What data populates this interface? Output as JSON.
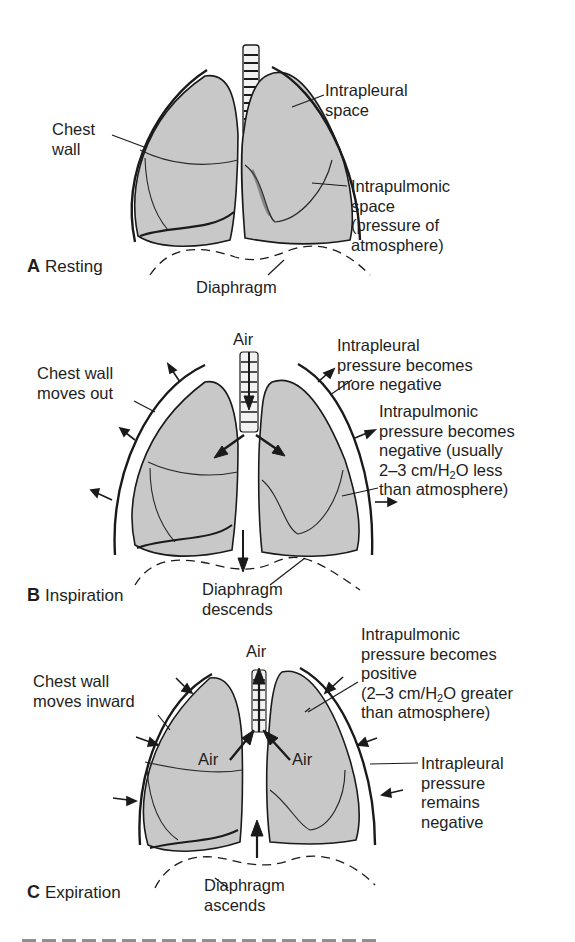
{
  "figure": {
    "panels": [
      {
        "id": "A",
        "letter": "A",
        "title": "Resting",
        "labels": {
          "chest_wall": [
            "Chest",
            "wall"
          ],
          "intrapleural": [
            "Intrapleural",
            "space"
          ],
          "intrapulmonic": [
            "Intrapulmonic",
            "space",
            "(pressure of",
            "atmosphere)"
          ],
          "diaphragm": [
            "Diaphragm"
          ]
        }
      },
      {
        "id": "B",
        "letter": "B",
        "title": "Inspiration",
        "labels": {
          "air": "Air",
          "chest_wall": [
            "Chest wall",
            "moves out"
          ],
          "intrapleural": [
            "Intrapleural",
            "pressure becomes",
            "more negative"
          ],
          "intrapulmonic": [
            "Intrapulmonic",
            "pressure becomes",
            "negative (usually",
            "2–3 cm/H",
            "2",
            "O less",
            "than atmosphere)"
          ],
          "diaphragm": [
            "Diaphragm",
            "descends"
          ]
        }
      },
      {
        "id": "C",
        "letter": "C",
        "title": "Expiration",
        "labels": {
          "air_top": "Air",
          "air_left": "Air",
          "air_right": "Air",
          "chest_wall": [
            "Chest wall",
            "moves inward"
          ],
          "intrapulmonic": [
            "Intrapulmonic",
            "pressure becomes",
            "positive",
            "(2–3 cm/H",
            "2",
            "O greater",
            "than atmosphere)"
          ],
          "intrapleural": [
            "Intrapleural",
            "pressure",
            "remains",
            "negative"
          ],
          "diaphragm": [
            "Diaphragm",
            "ascends"
          ]
        }
      }
    ],
    "colors": {
      "lung_fill": "#c8c8c8",
      "ink": "#1a1a1a",
      "background": "#ffffff"
    },
    "caption_partial": "(caption cut off at bottom edge)"
  }
}
